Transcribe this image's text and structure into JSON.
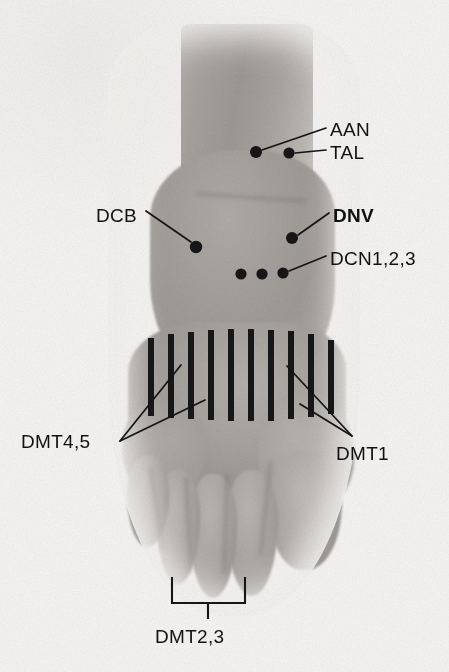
{
  "figure": {
    "kind": "anatomical-photograph",
    "background_color": "#f4f3f1",
    "skin_color": "#a7a39f",
    "ink_color": "#141414"
  },
  "labels": [
    {
      "id": "aan",
      "text": "AAN",
      "x": 330,
      "y": 120,
      "bold": false
    },
    {
      "id": "tal",
      "text": "TAL",
      "x": 330,
      "y": 143,
      "bold": false
    },
    {
      "id": "dcb",
      "text": "DCB",
      "x": 96,
      "y": 206,
      "bold": false
    },
    {
      "id": "dnv",
      "text": "DNV",
      "x": 333,
      "y": 206,
      "bold": true
    },
    {
      "id": "dcn",
      "text": "DCN1,2,3",
      "x": 330,
      "y": 249,
      "bold": false
    },
    {
      "id": "dmt45",
      "text": "DMT4,5",
      "x": 21,
      "y": 432,
      "bold": false
    },
    {
      "id": "dmt1",
      "text": "DMT1",
      "x": 336,
      "y": 444,
      "bold": false
    },
    {
      "id": "dmt23",
      "text": "DMT2,3",
      "x": 155,
      "y": 627,
      "bold": false
    }
  ],
  "markers": [
    {
      "id": "aan-dot",
      "label": "AAN",
      "cx": 256,
      "cy": 152,
      "r": 6.0
    },
    {
      "id": "tal-dot",
      "label": "TAL",
      "cx": 289,
      "cy": 153,
      "r": 5.6
    },
    {
      "id": "dcb-dot",
      "label": "DCB",
      "cx": 196,
      "cy": 247,
      "r": 6.2
    },
    {
      "id": "dnv-dot",
      "label": "DNV",
      "cx": 292,
      "cy": 238,
      "r": 6.0
    },
    {
      "id": "dcn1-dot",
      "label": "DCN1",
      "cx": 241,
      "cy": 274,
      "r": 5.6
    },
    {
      "id": "dcn2-dot",
      "label": "DCN2",
      "cx": 262,
      "cy": 274,
      "r": 5.6
    },
    {
      "id": "dcn3-dot",
      "label": "DCN3",
      "cx": 283,
      "cy": 273,
      "r": 5.6
    }
  ],
  "leaders": [
    {
      "id": "aan-leader",
      "from": "AAN dot",
      "path": "M 262 150 L 326 128"
    },
    {
      "id": "tal-leader",
      "from": "TAL dot",
      "path": "M 295 153 L 326 150"
    },
    {
      "id": "dcb-leader",
      "from": "DCB dot",
      "path": "M 191 242 L 146 211"
    },
    {
      "id": "dnv-leader",
      "from": "DNV dot",
      "path": "M 298 235 L 329 213"
    },
    {
      "id": "dcn-leader",
      "from": "DCN3 dot",
      "path": "M 289 271 L 326 256"
    },
    {
      "id": "dmt45-leader-a",
      "from": "DMT4,5",
      "path": "M 120 441 L 181 365"
    },
    {
      "id": "dmt45-leader-b",
      "from": "DMT4,5",
      "path": "M 120 441 L 205 400"
    },
    {
      "id": "dmt1-leader-a",
      "from": "DMT1",
      "path": "M 352 436 L 287 366"
    },
    {
      "id": "dmt1-leader-b",
      "from": "DMT1",
      "path": "M 352 436 L 300 404"
    }
  ],
  "metatarsal_bars": {
    "count": 10,
    "color": "#171717",
    "width": 6,
    "bars": [
      {
        "i": 1,
        "x": 148,
        "y": 338,
        "h": 78
      },
      {
        "i": 2,
        "x": 168,
        "y": 334,
        "h": 84
      },
      {
        "i": 3,
        "x": 188,
        "y": 332,
        "h": 87
      },
      {
        "i": 4,
        "x": 208,
        "y": 330,
        "h": 90
      },
      {
        "i": 5,
        "x": 228,
        "y": 329,
        "h": 92
      },
      {
        "i": 6,
        "x": 248,
        "y": 329,
        "h": 92
      },
      {
        "i": 7,
        "x": 268,
        "y": 330,
        "h": 91
      },
      {
        "i": 8,
        "x": 288,
        "y": 331,
        "h": 88
      },
      {
        "i": 9,
        "x": 308,
        "y": 334,
        "h": 83
      },
      {
        "i": 10,
        "x": 328,
        "y": 340,
        "h": 74
      }
    ]
  },
  "bracket": {
    "id": "dmt23-bracket",
    "left_x": 172,
    "right_x": 245,
    "top_y": 578,
    "bar_y": 603,
    "tick_y": 618,
    "tick_x": 208
  },
  "legend": {
    "AAN": "AAN",
    "TAL": "TAL",
    "DCB": "DCB",
    "DNV": "DNV",
    "DCN1,2,3": "DCN1,2,3",
    "DMT1": "DMT1",
    "DMT2,3": "DMT2,3",
    "DMT4,5": "DMT4,5"
  }
}
